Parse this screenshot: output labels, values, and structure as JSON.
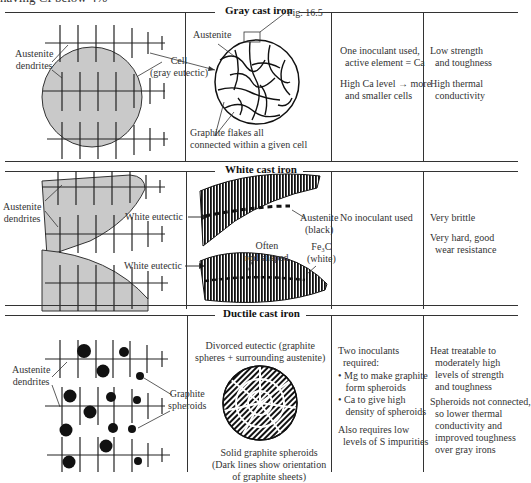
{
  "top_fragment": "having CI below 4%",
  "sections": [
    {
      "title": "Gray cast iron",
      "left_labels": {
        "dendrites": "Austenite\ndendrites",
        "cell": "Cell\n(gray eutectic)"
      },
      "micro_labels": {
        "austenite": "Austenite",
        "fig_ref": "Fig. 16.5",
        "flakes": "Graphite flakes all\nconnected within a given cell"
      },
      "inoculation": [
        "One inoculant used,\n  active element = Ca",
        "High Ca level → more\n  and smaller cells"
      ],
      "properties": [
        "Low strength\n  and toughness",
        "High thermal\n  conductivity"
      ]
    },
    {
      "title": "White cast iron",
      "left_labels": {
        "dendrites": "Austenite\ndendrites",
        "eutectic_1": "White eutectic",
        "eutectic_2": "White eutectic"
      },
      "micro_labels": {
        "austenite": "Austenite\n(black)",
        "rod": "Often\nrod shaped",
        "fe3c": "Fe₃C\n(white)"
      },
      "inoculation": [
        "No inoculant used"
      ],
      "properties": [
        "Very brittle",
        "Very hard, good\n  wear resistance"
      ]
    },
    {
      "title": "Ductile cast iron",
      "left_labels": {
        "dendrites": "Austenite\ndendrites",
        "spheroids": "Graphite\nspheroids"
      },
      "micro_labels": {
        "divorced": "Divorced eutectic (graphite\nspheres + surrounding austenite)",
        "solid": "Solid graphite spheroids\n(Dark lines show orientation\nof graphite sheets)"
      },
      "inoculation": [
        "Two inoculants\n  required:",
        "• Mg to make graphite\n   form spheroids\n• Ca to give high\n   density of spheroids",
        "Also requires low\n  levels of S impurities"
      ],
      "properties": [
        "Heat treatable to\n  moderately high\n  levels of strength\n  and toughness",
        "Spheroids not connected,\n  so lower thermal\n  conductivity and\n  improved toughness\n  over gray irons"
      ]
    }
  ],
  "colors": {
    "line": "#333333",
    "fill_gray": "#c9c9c9",
    "text": "#333333"
  }
}
